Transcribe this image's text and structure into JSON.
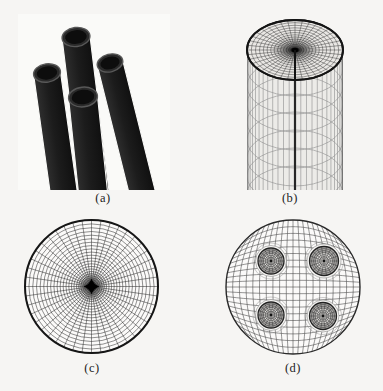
{
  "page": {
    "width": 383,
    "height": 391,
    "background": "#f6f5f3"
  },
  "panels": {
    "a": {
      "label": "(a)",
      "content": "photograph-of-four-black-cylindrical-tubes"
    },
    "b": {
      "label": "(b)",
      "content": "3d-wireframe-mesh-of-cylinder-with-polar-top-cap"
    },
    "c": {
      "label": "(c)",
      "content": "circular-cross-section-polar-mesh-dense-center"
    },
    "d": {
      "label": "(d)",
      "content": "circular-cross-section-mesh-with-four-circular-inclusions"
    }
  },
  "colors": {
    "page_bg": "#f6f5f3",
    "photo_bg": "#fafaf8",
    "tube_light": "#2e2e2e",
    "tube_mid": "#1c1c1c",
    "tube_dark": "#101010",
    "tube_rim_stroke": "#585858",
    "tube_rim_fill": "#2a2a2a",
    "tube_hole": "#0d0d0d",
    "cyl_body_fill": "#ecebe8",
    "cyl_body_line": "#8d8d8d",
    "cyl_ring_line": "#9b9b9b",
    "cyl_edge_line": "#5a5a5a",
    "cyl_seam": "#262626",
    "cap_fill": "#e9e7e4",
    "cap_stroke": "#141414",
    "cap_mesh": "#2e2e2e",
    "mesh_dark": "#222222",
    "disk_boundary": "#161616",
    "grid_line": "#3f3f3f",
    "incl_fill": "#dedcd9",
    "incl_stroke": "#222222",
    "incl_mesh": "#333333",
    "incl_shade": "rgba(40,40,40,0.28)",
    "wrap_line": "#8a8a8a",
    "caption_color": "#1c1c1c"
  },
  "geometry": {
    "tubes": {
      "svg_w": 152,
      "svg_h": 176,
      "list": [
        {
          "x": 58,
          "y": 23,
          "w": 28,
          "rot": -7,
          "len": 162
        },
        {
          "x": 29,
          "y": 59,
          "w": 27,
          "rot": -8,
          "len": 126
        },
        {
          "x": 92,
          "y": 49,
          "w": 26,
          "rot": -14,
          "len": 138
        },
        {
          "x": 65,
          "y": 83,
          "w": 29,
          "rot": -6,
          "len": 102
        }
      ]
    },
    "cylinder": {
      "svg_w": 104,
      "svg_h": 176,
      "cx": 52,
      "cap_cy": 34,
      "rx": 48,
      "ry": 30,
      "body_top": 34,
      "body_bottom": 174,
      "n_vert": 26,
      "ring_ry": 28,
      "ring_start": 52,
      "ring_step": 18,
      "n_body_rings": 8,
      "cap_spokes": 40,
      "cap_rings": 16,
      "cap_ring_pow": 1.45
    },
    "polar_disk": {
      "svg_w": 140,
      "svg_h": 140,
      "cx": 69.5,
      "cy": 69.5,
      "r": 66.5,
      "spokes": 44,
      "rings": 26,
      "ring_pow": 1.55,
      "inner_hole": 0.03,
      "star_size": 8
    },
    "inclusion_disk": {
      "svg_w": 140,
      "svg_h": 140,
      "cx": 70,
      "cy": 70,
      "r": 67,
      "grid_lines": 19,
      "inclusions": [
        {
          "cx": 48,
          "cy": 44,
          "r": 13
        },
        {
          "cx": 101,
          "cy": 44,
          "r": 14.5
        },
        {
          "cx": 48,
          "cy": 98,
          "r": 13
        },
        {
          "cx": 100,
          "cy": 99,
          "r": 13.5
        }
      ],
      "incl_rings": [
        0.86,
        0.72,
        0.58,
        0.44,
        0.3
      ],
      "incl_spokes": 18
    }
  }
}
